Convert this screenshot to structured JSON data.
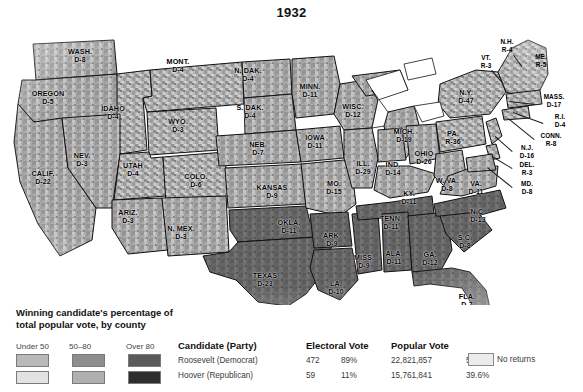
{
  "title": "1932",
  "map": {
    "caption": "1932 United States presidential election results by county",
    "states": [
      {
        "name": "WASH.",
        "result": "D-8",
        "x": 80,
        "y": 38
      },
      {
        "name": "OREGON",
        "result": "D-5",
        "x": 48,
        "y": 80
      },
      {
        "name": "IDAHO",
        "result": "D-4",
        "x": 113,
        "y": 95
      },
      {
        "name": "MONT.",
        "result": "D-4",
        "x": 178,
        "y": 48
      },
      {
        "name": "WYO.",
        "result": "D-3",
        "x": 178,
        "y": 108
      },
      {
        "name": "NEV.",
        "result": "D-3",
        "x": 82,
        "y": 142
      },
      {
        "name": "UTAH",
        "result": "D-4",
        "x": 133,
        "y": 152
      },
      {
        "name": "CALIF.",
        "result": "D-22",
        "x": 43,
        "y": 160
      },
      {
        "name": "ARIZ.",
        "result": "D-3",
        "x": 128,
        "y": 199
      },
      {
        "name": "N. MEX.",
        "result": "D-3",
        "x": 181,
        "y": 215
      },
      {
        "name": "COLO.",
        "result": "D-6",
        "x": 196,
        "y": 163
      },
      {
        "name": "N. DAK.",
        "result": "D-4",
        "x": 248,
        "y": 57
      },
      {
        "name": "S. DAK.",
        "result": "D-4",
        "x": 250,
        "y": 94
      },
      {
        "name": "NEB.",
        "result": "D-7",
        "x": 258,
        "y": 131
      },
      {
        "name": "KANSAS",
        "result": "D-9",
        "x": 272,
        "y": 174
      },
      {
        "name": "OKLA.",
        "result": "D-11",
        "x": 289,
        "y": 209
      },
      {
        "name": "TEXAS",
        "result": "D-23",
        "x": 265,
        "y": 262
      },
      {
        "name": "MINN.",
        "result": "D-11",
        "x": 310,
        "y": 73
      },
      {
        "name": "IOWA",
        "result": "D-11",
        "x": 315,
        "y": 124
      },
      {
        "name": "MO.",
        "result": "D-15",
        "x": 334,
        "y": 170
      },
      {
        "name": "ARK.",
        "result": "D-9",
        "x": 332,
        "y": 222
      },
      {
        "name": "LA.",
        "result": "D-10",
        "x": 336,
        "y": 270
      },
      {
        "name": "WISC.",
        "result": "D-12",
        "x": 353,
        "y": 93
      },
      {
        "name": "ILL.",
        "result": "D-29",
        "x": 363,
        "y": 150
      },
      {
        "name": "MISS.",
        "result": "D-9",
        "x": 364,
        "y": 244
      },
      {
        "name": "MICH.",
        "result": "D-19",
        "x": 404,
        "y": 118
      },
      {
        "name": "IND.",
        "result": "D-14",
        "x": 393,
        "y": 151
      },
      {
        "name": "TENN.",
        "result": "D-11",
        "x": 391,
        "y": 205
      },
      {
        "name": "ALA.",
        "result": "D-11",
        "x": 394,
        "y": 240
      },
      {
        "name": "OHIO",
        "result": "D-26",
        "x": 424,
        "y": 140
      },
      {
        "name": "KY.",
        "result": "D-11",
        "x": 409,
        "y": 180
      },
      {
        "name": "GA.",
        "result": "D-12",
        "x": 430,
        "y": 241
      },
      {
        "name": "FLA.",
        "result": "D-7",
        "x": 467,
        "y": 283
      },
      {
        "name": "W. VA.",
        "result": "D-8",
        "x": 447,
        "y": 167
      },
      {
        "name": "VA.",
        "result": "D-11",
        "x": 476,
        "y": 170
      },
      {
        "name": "N.C.",
        "result": "D-13",
        "x": 478,
        "y": 198
      },
      {
        "name": "S.C.",
        "result": "D-8",
        "x": 465,
        "y": 224
      },
      {
        "name": "PA.",
        "result": "R-36",
        "x": 453,
        "y": 120
      },
      {
        "name": "N.Y.",
        "result": "D-47",
        "x": 466,
        "y": 79
      }
    ],
    "callouts": [
      {
        "name": "N.H.",
        "result": "R-4",
        "x": 507,
        "y": 28,
        "lx": 514,
        "ly": 37,
        "tx": 522,
        "ty": 48
      },
      {
        "name": "VT.",
        "result": "R-3",
        "x": 486,
        "y": 44,
        "lx": 492,
        "ly": 52,
        "tx": 504,
        "ty": 66
      },
      {
        "name": "ME.",
        "result": "R-5",
        "x": 541,
        "y": 43,
        "lx": 541,
        "ly": 52,
        "tx": 541,
        "ty": 52
      },
      {
        "name": "MASS.",
        "result": "D-17",
        "x": 554,
        "y": 83,
        "lx": 535,
        "ly": 87,
        "tx": 509,
        "ty": 84
      },
      {
        "name": "R.I.",
        "result": "D-4",
        "x": 560,
        "y": 103,
        "lx": 543,
        "ly": 106,
        "tx": 513,
        "ty": 95
      },
      {
        "name": "CONN.",
        "result": "R-8",
        "x": 551,
        "y": 122,
        "lx": 534,
        "ly": 122,
        "tx": 508,
        "ty": 101
      },
      {
        "name": "N.J.",
        "result": "D-16",
        "x": 527,
        "y": 134,
        "lx": 512,
        "ly": 134,
        "tx": 495,
        "ty": 119
      },
      {
        "name": "DEL.",
        "result": "R-3",
        "x": 527,
        "y": 151,
        "lx": 512,
        "ly": 151,
        "tx": 492,
        "ty": 139
      },
      {
        "name": "MD.",
        "result": "D-8",
        "x": 527,
        "y": 170,
        "lx": 512,
        "ly": 170,
        "tx": 487,
        "ty": 150
      }
    ]
  },
  "legend": {
    "title": "Winning candidate's percentage of total popular vote, by county",
    "classes": [
      {
        "label": "Under 50",
        "democrat_color": "#b9b9b9",
        "republican_color": "#e2e2e2"
      },
      {
        "label": "50–80",
        "democrat_color": "#8e8e8e",
        "republican_color": "#b0b0b0"
      },
      {
        "label": "Over 80",
        "democrat_color": "#5a5a5a",
        "republican_color": "#2e2e2e"
      }
    ],
    "no_returns_label": "No returns",
    "no_returns_color": "#ebebeb"
  },
  "results_table": {
    "headers": {
      "candidate": "Candidate (Party)",
      "electoral": "Electoral Vote",
      "popular": "Popular Vote"
    },
    "rows": [
      {
        "candidate": "Roosevelt (Democrat)",
        "electoral_vote": "472",
        "electoral_pct": "89%",
        "popular_vote": "22,821,857",
        "popular_pct": "57.3%"
      },
      {
        "candidate": "Hoover (Republican)",
        "electoral_vote": "59",
        "electoral_pct": "11%",
        "popular_vote": "15,761,841",
        "popular_pct": "39.6%"
      }
    ]
  }
}
